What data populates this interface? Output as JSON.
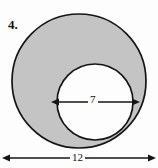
{
  "figure": {
    "problem_number": "4.",
    "shape": "annulus"
  },
  "colors": {
    "shaded_fill": "#c4c4c4",
    "unshaded_fill": "#ffffff",
    "stroke": "#151515",
    "background": "#fdfdfd",
    "text": "#111111"
  },
  "dimensions": {
    "inner_diameter": {
      "label": "7",
      "name": "inner-diameter",
      "orientation": "horizontal",
      "arrow_style": "double-headed"
    },
    "outer_diameter": {
      "label": "12",
      "name": "outer-diameter",
      "orientation": "horizontal",
      "arrow_style": "double-headed"
    }
  },
  "geometry": {
    "outer_circle": {
      "cx": 79,
      "cy": 81,
      "r": 67
    },
    "inner_circle": {
      "cx": 95,
      "cy": 102,
      "r": 38
    },
    "inner_arrow": {
      "x1": 58,
      "x2": 133,
      "y": 102
    },
    "outer_arrow": {
      "x1": 9,
      "x2": 149,
      "y": 158
    }
  }
}
